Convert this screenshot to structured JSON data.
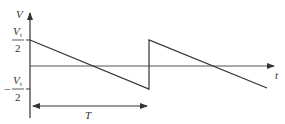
{
  "diagram": {
    "type": "sawtooth-waveform",
    "axes": {
      "y_label": "V",
      "x_label": "t"
    },
    "levels": {
      "top": {
        "numerator": "V",
        "subscript": "t",
        "denominator": "2",
        "sign": ""
      },
      "bottom": {
        "numerator": "V",
        "subscript": "t",
        "denominator": "2",
        "sign": "−"
      }
    },
    "period_label": "T",
    "colors": {
      "stroke": "#333333",
      "background": "#ffffff"
    }
  }
}
